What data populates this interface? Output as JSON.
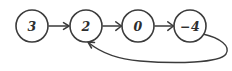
{
  "diagram": {
    "type": "linked-list-cycle",
    "background_color": "#ffffff",
    "stroke_color": "#3b3b3b",
    "text_color": "#2e2e2e",
    "style": "hand-drawn",
    "nodes": [
      {
        "id": "n0",
        "label": "3",
        "cx": 32,
        "cy": 26,
        "r": 16
      },
      {
        "id": "n1",
        "label": "2",
        "cx": 86,
        "cy": 26,
        "r": 16
      },
      {
        "id": "n2",
        "label": "0",
        "cx": 138,
        "cy": 26,
        "r": 16
      },
      {
        "id": "n3",
        "label": "−4",
        "cx": 190,
        "cy": 26,
        "r": 16
      }
    ],
    "edges": [
      {
        "id": "e0",
        "from": "n0",
        "to": "n1",
        "kind": "straight",
        "path": "M 49 26 L 68 26",
        "arrow": "M 63.5 22.6 L 69 26 L 63.5 29.4"
      },
      {
        "id": "e1",
        "from": "n1",
        "to": "n2",
        "kind": "straight",
        "path": "M 103 26 L 121 26",
        "arrow": "M 115.8 21.8 L 121.5 26 L 115.8 30.4"
      },
      {
        "id": "e2",
        "from": "n2",
        "to": "n3",
        "kind": "straight",
        "path": "M 155 26 L 173 26",
        "arrow": "M 167.8 21.8 L 173.5 26 L 167.8 30.4"
      },
      {
        "id": "e3",
        "from": "n3",
        "to": "n1",
        "kind": "curved-back-edge",
        "path": "M 203 34 C 220 38 231 46 226 54 C 220 63 176 64 140 61 C 116 59 100 52 89 43",
        "arrow": "M 94.5 42.5 L 88 42 L 91.5 48"
      }
    ]
  }
}
